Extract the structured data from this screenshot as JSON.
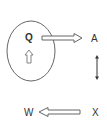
{
  "diagram": {
    "labels": {
      "q": "Q",
      "a": "A",
      "w": "W",
      "x": "X"
    },
    "colors": {
      "stroke": "#555555",
      "text": "#333333",
      "background": "#ffffff"
    }
  }
}
